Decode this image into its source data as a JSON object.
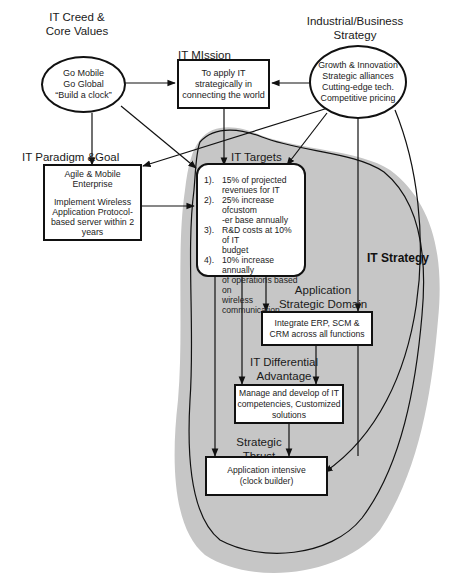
{
  "diagram": {
    "creed": {
      "title_line1": "IT Creed &",
      "title_line2": "Core Values",
      "lines": [
        "Go Mobile",
        "Go Global",
        "“Build a clock”"
      ]
    },
    "mission": {
      "title": "IT MIssion",
      "lines": [
        "To apply IT",
        "strategically in",
        "connecting the world"
      ]
    },
    "industrial": {
      "title_line1": "Industrial/Business",
      "title_line2": "Strategy",
      "lines": [
        "Growth & Innovation",
        "Strategic alliances",
        "Cutting-edge tech.",
        "Competitive pricing"
      ]
    },
    "paradigm": {
      "title_left": "IT Paradigm &",
      "title_right": "Goal",
      "lines": [
        "Agile & Mobile",
        "Enterprise",
        "",
        "Implement Wireless",
        "Application Protocol-",
        "based server within 2",
        "years"
      ]
    },
    "targets": {
      "title": "IT Targets",
      "items": [
        {
          "num": "1).",
          "text": "15% of projected\nrevenues for IT"
        },
        {
          "num": "2).",
          "text": "25% increase ofcustom\n-er base annually"
        },
        {
          "num": "3).",
          "text": "R&D costs at 10% of IT\nbudget"
        },
        {
          "num": "4).",
          "text": "10% increase annually\nof operations based on\nwireless communication"
        }
      ]
    },
    "app_domain": {
      "title_line1": "Application",
      "title_line2": "Strategic Domain",
      "lines": [
        "Integrate ERP, SCM &",
        "CRM across all functions"
      ]
    },
    "differential": {
      "title_line1": "IT Differential",
      "title_line2": "Advantage",
      "lines": [
        "Manage and develop of IT",
        "competencies, Customized",
        "solutions"
      ]
    },
    "thrust": {
      "title_line1": "Strategic",
      "title_line2": "Thrust",
      "lines": [
        "Application intensive",
        "(clock builder)"
      ]
    },
    "region_label": "IT Strategy",
    "colors": {
      "region_fill": "#c8c8c8",
      "stroke": "#111111",
      "box_fill": "#ffffff"
    }
  }
}
